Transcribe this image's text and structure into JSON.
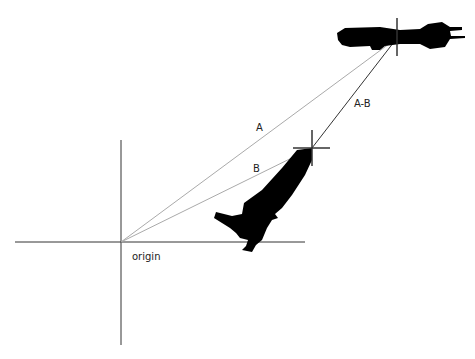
{
  "diagram": {
    "labels": {
      "vector_a": "A",
      "vector_b": "B",
      "vector_a_minus_b": "A-B",
      "origin": "origin"
    },
    "icons": {
      "target_ship": "spaceship-silhouette-icon",
      "player_ship": "rocket-silhouette-icon",
      "crosshair": "crosshair-icon"
    },
    "colors": {
      "axis": "#333333",
      "vector_light": "#aaaaaa",
      "vector_dark": "#333333",
      "silhouette": "#000000"
    }
  }
}
